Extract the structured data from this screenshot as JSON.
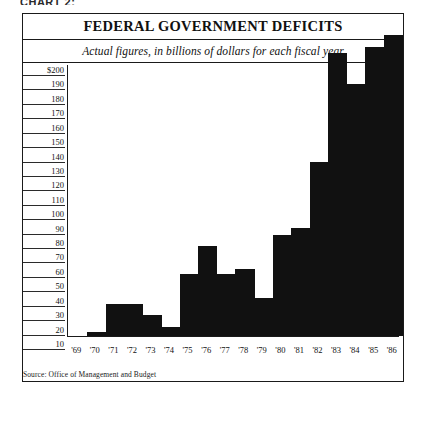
{
  "page": {
    "figure_caption": "CHART 2:"
  },
  "chart_data": {
    "type": "bar",
    "title": "FEDERAL GOVERNMENT DEFICITS",
    "subtitle": "Actual figures, in billions of dollars for each fiscal year",
    "xlabel": "",
    "ylabel": "",
    "ylim": [
      0,
      200
    ],
    "ytick_step": 10,
    "grid": false,
    "legend": false,
    "source_note": "Source: Office of Management and Budget",
    "ytick_labels": [
      "$200",
      "190",
      "180",
      "170",
      "160",
      "150",
      "140",
      "130",
      "120",
      "110",
      "100",
      "90",
      "80",
      "70",
      "60",
      "50",
      "40",
      "30",
      "20",
      "10"
    ],
    "ytick_values": [
      200,
      190,
      180,
      170,
      160,
      150,
      140,
      130,
      120,
      110,
      100,
      90,
      80,
      70,
      60,
      50,
      40,
      30,
      20,
      10
    ],
    "categories": [
      "'69",
      "'70",
      "'71",
      "'72",
      "'73",
      "'74",
      "'75",
      "'76",
      "'77",
      "'78",
      "'79",
      "'80",
      "'81",
      "'82",
      "'83",
      "'84",
      "'85",
      "'86"
    ],
    "values": [
      0,
      3,
      23,
      23,
      15,
      6,
      45,
      66,
      45,
      49,
      28,
      74,
      79,
      128,
      208,
      185,
      212,
      221
    ],
    "bar_color": "#111111"
  }
}
